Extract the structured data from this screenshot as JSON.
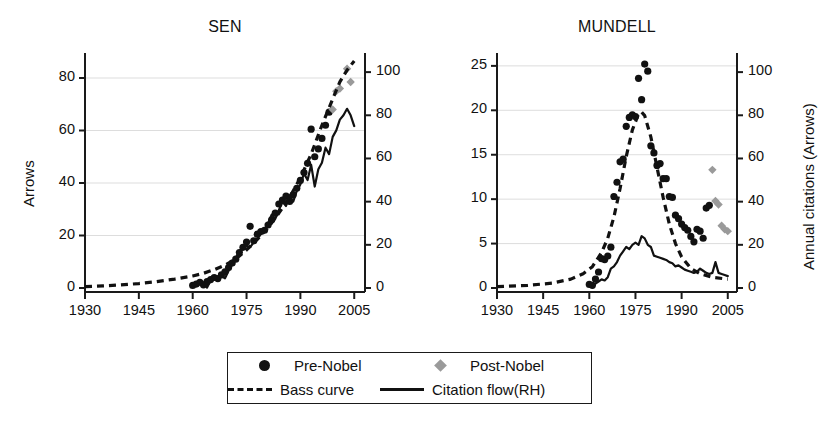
{
  "figure": {
    "background": "#ffffff",
    "marker_color_pre": "#111111",
    "marker_color_post": "#9a9a9a",
    "grid_color": "#d9d9d9",
    "axis_color": "#1a1a1a"
  },
  "legend": {
    "items": [
      {
        "label": "Pre-Nobel",
        "marker": "filled-circle-icon",
        "color": "#111111"
      },
      {
        "label": "Post-Nobel",
        "marker": "filled-diamond-icon",
        "color": "#9a9a9a"
      },
      {
        "label": "Bass curve",
        "marker": "dashed-line-icon",
        "color": "#111111"
      },
      {
        "label": "Citation flow(RH)",
        "marker": "solid-line-icon",
        "color": "#111111"
      }
    ]
  },
  "chart_data": [
    {
      "type": "scatter",
      "title": "SEN",
      "xlabel": "",
      "ylabel": "Arrows",
      "y2label": "",
      "xlim": [
        1930,
        2008
      ],
      "ylim": [
        0,
        88
      ],
      "y2lim": [
        0,
        107
      ],
      "xticks": [
        1930,
        1945,
        1960,
        1975,
        1990,
        2005
      ],
      "yticks": [
        0,
        20,
        40,
        60,
        80
      ],
      "y2ticks": [
        0,
        20,
        40,
        60,
        80,
        100
      ],
      "grid": "horizontal",
      "legend_position": "below-figure",
      "series": [
        {
          "name": "Pre-Nobel",
          "type": "scatter",
          "marker": "filled-circle",
          "color": "#111111",
          "axis": "left",
          "points": [
            [
              1960,
              1.0
            ],
            [
              1961,
              1.5
            ],
            [
              1962,
              2.2
            ],
            [
              1963,
              1.2
            ],
            [
              1964,
              2.4
            ],
            [
              1965,
              3.2
            ],
            [
              1966,
              4.0
            ],
            [
              1967,
              3.6
            ],
            [
              1968,
              5.0
            ],
            [
              1969,
              6.2
            ],
            [
              1970,
              7.8
            ],
            [
              1971,
              9.5
            ],
            [
              1972,
              11.0
            ],
            [
              1973,
              13.5
            ],
            [
              1974,
              15.5
            ],
            [
              1975,
              17.5
            ],
            [
              1976,
              23.5
            ],
            [
              1977,
              18.0
            ],
            [
              1978,
              20.5
            ],
            [
              1979,
              21.5
            ],
            [
              1980,
              22.0
            ],
            [
              1981,
              24.0
            ],
            [
              1982,
              26.0
            ],
            [
              1983,
              28.5
            ],
            [
              1984,
              32.0
            ],
            [
              1985,
              33.5
            ],
            [
              1986,
              35.0
            ],
            [
              1987,
              33.0
            ],
            [
              1988,
              35.5
            ],
            [
              1989,
              38.0
            ],
            [
              1990,
              41.0
            ],
            [
              1991,
              44.0
            ],
            [
              1992,
              47.5
            ],
            [
              1993,
              60.5
            ],
            [
              1994,
              50.0
            ],
            [
              1995,
              53.0
            ],
            [
              1996,
              57.0
            ],
            [
              1997,
              62.0
            ],
            [
              1998,
              67.0
            ]
          ]
        },
        {
          "name": "Post-Nobel",
          "type": "scatter",
          "marker": "filled-diamond",
          "color": "#9a9a9a",
          "axis": "left",
          "points": [
            [
              1999,
              68.0
            ],
            [
              2000,
              75.0
            ],
            [
              2001,
              76.0
            ],
            [
              2003,
              83.5
            ],
            [
              2004,
              78.5
            ]
          ]
        },
        {
          "name": "Bass curve",
          "type": "line",
          "style": "dashed",
          "color": "#111111",
          "axis": "left",
          "points": [
            [
              1930,
              0.5
            ],
            [
              1935,
              0.8
            ],
            [
              1940,
              1.2
            ],
            [
              1945,
              1.7
            ],
            [
              1950,
              2.4
            ],
            [
              1955,
              3.4
            ],
            [
              1960,
              4.6
            ],
            [
              1963,
              5.6
            ],
            [
              1966,
              7.0
            ],
            [
              1969,
              8.7
            ],
            [
              1972,
              11.0
            ],
            [
              1975,
              14.5
            ],
            [
              1978,
              18.5
            ],
            [
              1981,
              23.0
            ],
            [
              1984,
              28.5
            ],
            [
              1987,
              34.5
            ],
            [
              1990,
              42.0
            ],
            [
              1993,
              51.0
            ],
            [
              1996,
              62.0
            ],
            [
              1999,
              72.0
            ],
            [
              2001,
              78.5
            ],
            [
              2003,
              83.0
            ],
            [
              2005,
              86.5
            ]
          ]
        },
        {
          "name": "Citation flow(RH)",
          "type": "line",
          "style": "solid",
          "color": "#111111",
          "axis": "right",
          "points": [
            [
              1960,
              1.5
            ],
            [
              1961,
              1.0
            ],
            [
              1962,
              3.0
            ],
            [
              1963,
              2.5
            ],
            [
              1964,
              0.2
            ],
            [
              1965,
              3.5
            ],
            [
              1966,
              5.0
            ],
            [
              1967,
              4.0
            ],
            [
              1968,
              5.5
            ],
            [
              1969,
              4.5
            ],
            [
              1970,
              8.0
            ],
            [
              1971,
              11.0
            ],
            [
              1972,
              14.0
            ],
            [
              1973,
              17.0
            ],
            [
              1974,
              18.0
            ],
            [
              1975,
              19.5
            ],
            [
              1976,
              19.0
            ],
            [
              1977,
              21.0
            ],
            [
              1978,
              23.0
            ],
            [
              1979,
              25.0
            ],
            [
              1980,
              26.5
            ],
            [
              1981,
              30.0
            ],
            [
              1982,
              34.0
            ],
            [
              1983,
              32.0
            ],
            [
              1984,
              36.0
            ],
            [
              1985,
              40.0
            ],
            [
              1986,
              38.0
            ],
            [
              1987,
              43.0
            ],
            [
              1988,
              40.0
            ],
            [
              1989,
              45.0
            ],
            [
              1990,
              48.0
            ],
            [
              1991,
              53.0
            ],
            [
              1992,
              50.0
            ],
            [
              1993,
              57.0
            ],
            [
              1994,
              47.0
            ],
            [
              1995,
              55.0
            ],
            [
              1996,
              58.0
            ],
            [
              1997,
              65.0
            ],
            [
              1998,
              62.0
            ],
            [
              1999,
              70.0
            ],
            [
              2000,
              73.0
            ],
            [
              2001,
              78.0
            ],
            [
              2002,
              80.0
            ],
            [
              2003,
              83.0
            ],
            [
              2004,
              80.0
            ],
            [
              2005,
              75.0
            ]
          ]
        }
      ]
    },
    {
      "type": "scatter",
      "title": "MUNDELL",
      "xlabel": "",
      "ylabel": "",
      "y2label": "Annual citations (Arrows)",
      "xlim": [
        1930,
        2008
      ],
      "ylim": [
        0,
        26
      ],
      "y2lim": [
        0,
        107
      ],
      "xticks": [
        1930,
        1945,
        1960,
        1975,
        1990,
        2005
      ],
      "yticks": [
        0,
        5,
        10,
        15,
        20,
        25
      ],
      "y2ticks": [
        0,
        20,
        40,
        60,
        80,
        100
      ],
      "grid": "horizontal",
      "legend_position": "below-figure",
      "series": [
        {
          "name": "Pre-Nobel",
          "type": "scatter",
          "marker": "filled-circle",
          "color": "#111111",
          "axis": "left",
          "points": [
            [
              1960,
              0.4
            ],
            [
              1961,
              0.3
            ],
            [
              1962,
              1.0
            ],
            [
              1963,
              1.8
            ],
            [
              1964,
              3.3
            ],
            [
              1965,
              3.2
            ],
            [
              1966,
              3.6
            ],
            [
              1967,
              4.6
            ],
            [
              1968,
              10.3
            ],
            [
              1969,
              11.9
            ],
            [
              1970,
              14.2
            ],
            [
              1971,
              14.5
            ],
            [
              1972,
              18.2
            ],
            [
              1973,
              19.2
            ],
            [
              1974,
              19.5
            ],
            [
              1975,
              19.3
            ],
            [
              1976,
              23.6
            ],
            [
              1977,
              21.2
            ],
            [
              1978,
              25.2
            ],
            [
              1979,
              24.4
            ],
            [
              1980,
              16.0
            ],
            [
              1981,
              15.2
            ],
            [
              1982,
              13.8
            ],
            [
              1983,
              14.0
            ],
            [
              1984,
              12.3
            ],
            [
              1985,
              12.3
            ],
            [
              1986,
              10.3
            ],
            [
              1987,
              10.2
            ],
            [
              1988,
              8.2
            ],
            [
              1989,
              7.8
            ],
            [
              1990,
              7.2
            ],
            [
              1991,
              6.8
            ],
            [
              1992,
              6.5
            ],
            [
              1993,
              5.8
            ],
            [
              1994,
              5.2
            ],
            [
              1995,
              6.6
            ],
            [
              1996,
              6.4
            ],
            [
              1997,
              5.6
            ],
            [
              1998,
              9.0
            ],
            [
              1999,
              9.3
            ]
          ]
        },
        {
          "name": "Post-Nobel",
          "type": "scatter",
          "marker": "filled-diamond",
          "color": "#9a9a9a",
          "axis": "left",
          "points": [
            [
              2000,
              13.3
            ],
            [
              2001,
              9.8
            ],
            [
              2002,
              9.4
            ],
            [
              2003,
              7.0
            ],
            [
              2004,
              6.6
            ],
            [
              2005,
              6.4
            ]
          ]
        },
        {
          "name": "Bass curve",
          "type": "line",
          "style": "dashed",
          "color": "#111111",
          "axis": "left",
          "points": [
            [
              1930,
              0.15
            ],
            [
              1940,
              0.3
            ],
            [
              1948,
              0.55
            ],
            [
              1954,
              1.0
            ],
            [
              1958,
              1.6
            ],
            [
              1961,
              2.4
            ],
            [
              1964,
              4.0
            ],
            [
              1966,
              5.6
            ],
            [
              1968,
              8.0
            ],
            [
              1970,
              11.2
            ],
            [
              1972,
              14.8
            ],
            [
              1974,
              17.8
            ],
            [
              1976,
              19.6
            ],
            [
              1977,
              19.8
            ],
            [
              1978,
              19.4
            ],
            [
              1980,
              17.0
            ],
            [
              1982,
              13.6
            ],
            [
              1984,
              10.2
            ],
            [
              1986,
              7.2
            ],
            [
              1988,
              5.0
            ],
            [
              1990,
              3.5
            ],
            [
              1993,
              2.2
            ],
            [
              1996,
              1.6
            ],
            [
              2000,
              1.2
            ],
            [
              2005,
              1.0
            ]
          ]
        },
        {
          "name": "Citation flow(RH)",
          "type": "line",
          "style": "solid",
          "color": "#111111",
          "axis": "right",
          "points": [
            [
              1960,
              1.0
            ],
            [
              1961,
              0.5
            ],
            [
              1962,
              2.0
            ],
            [
              1963,
              3.0
            ],
            [
              1964,
              4.0
            ],
            [
              1965,
              3.5
            ],
            [
              1966,
              5.0
            ],
            [
              1967,
              9.0
            ],
            [
              1968,
              10.0
            ],
            [
              1969,
              12.0
            ],
            [
              1970,
              15.0
            ],
            [
              1971,
              17.0
            ],
            [
              1972,
              19.0
            ],
            [
              1973,
              18.0
            ],
            [
              1974,
              20.0
            ],
            [
              1975,
              21.0
            ],
            [
              1976,
              20.0
            ],
            [
              1977,
              24.0
            ],
            [
              1978,
              23.0
            ],
            [
              1979,
              20.0
            ],
            [
              1980,
              19.0
            ],
            [
              1981,
              15.0
            ],
            [
              1982,
              14.5
            ],
            [
              1983,
              14.0
            ],
            [
              1984,
              13.5
            ],
            [
              1985,
              13.0
            ],
            [
              1986,
              12.0
            ],
            [
              1987,
              11.5
            ],
            [
              1988,
              10.0
            ],
            [
              1989,
              10.5
            ],
            [
              1990,
              9.5
            ],
            [
              1991,
              8.5
            ],
            [
              1992,
              8.0
            ],
            [
              1993,
              7.5
            ],
            [
              1994,
              7.0
            ],
            [
              1995,
              7.5
            ],
            [
              1996,
              9.0
            ],
            [
              1997,
              8.0
            ],
            [
              1998,
              7.0
            ],
            [
              1999,
              6.5
            ],
            [
              2000,
              7.0
            ],
            [
              2001,
              12.0
            ],
            [
              2002,
              7.0
            ],
            [
              2003,
              6.5
            ],
            [
              2004,
              6.0
            ],
            [
              2005,
              5.5
            ]
          ]
        }
      ]
    }
  ]
}
